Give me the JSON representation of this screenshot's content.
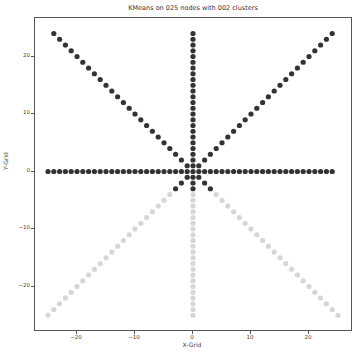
{
  "chart_data": {
    "type": "scatter",
    "title": "KMeans on 025 nodes with 002 clusters",
    "xlabel": "X-Grid",
    "ylabel": "Y-Grid",
    "xlim": [
      -27,
      27
    ],
    "ylim": [
      -27,
      27
    ],
    "xticks": [
      -20,
      -10,
      0,
      10,
      20
    ],
    "yticks": [
      -20,
      -10,
      0,
      10,
      20
    ],
    "grid": false,
    "legend": null,
    "structure": "8-arm star centered at origin (horizontal, vertical, both diagonals) with points at integer steps, plus 3x3 center block",
    "arm_length": 25,
    "series": [
      {
        "name": "cluster 0 (dark)",
        "color": "#333333",
        "rule": "y >= -3"
      },
      {
        "name": "cluster 1 (light)",
        "color": "#d6d6d6",
        "rule": "y < -3"
      }
    ],
    "arms": [
      {
        "dx": 1,
        "dy": 0,
        "max": 24
      },
      {
        "dx": -1,
        "dy": 0,
        "max": 25
      },
      {
        "dx": 0,
        "dy": 1,
        "max": 24
      },
      {
        "dx": 0,
        "dy": -1,
        "max": 25
      },
      {
        "dx": 1,
        "dy": 1,
        "max": 24
      },
      {
        "dx": -1,
        "dy": 1,
        "max": 24
      },
      {
        "dx": 1,
        "dy": -1,
        "max": 25
      },
      {
        "dx": -1,
        "dy": -1,
        "max": 25
      }
    ],
    "center_block": [
      [
        -1,
        -1
      ],
      [
        0,
        -1
      ],
      [
        1,
        -1
      ],
      [
        -1,
        0
      ],
      [
        0,
        0
      ],
      [
        1,
        0
      ],
      [
        -1,
        1
      ],
      [
        0,
        1
      ],
      [
        1,
        1
      ]
    ],
    "dark_threshold_y": -3
  }
}
